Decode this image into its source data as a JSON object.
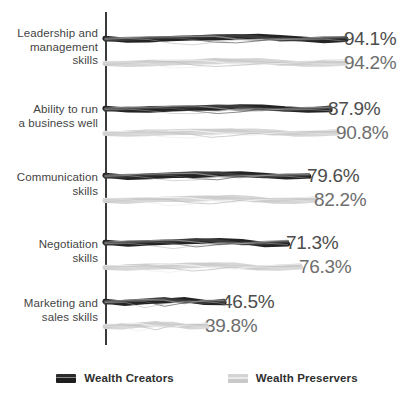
{
  "chart_data": {
    "type": "bar",
    "orientation": "horizontal",
    "title": "",
    "subtitle": "",
    "xlabel": "",
    "ylabel": "",
    "grid": false,
    "xlim": [
      0,
      100
    ],
    "legend_position": "bottom-center",
    "categories": [
      "Leadership and\nmanagement\nskills",
      "Ability to run\na business well",
      "Communication\nskills",
      "Negotiation\nskills",
      "Marketing and\nsales skills"
    ],
    "series": [
      {
        "name": "Wealth Creators",
        "color": "#2b2b2b",
        "values": [
          94.1,
          87.9,
          79.6,
          71.3,
          46.5
        ],
        "labels": [
          "94.1%",
          "87.9%",
          "79.6%",
          "71.3%",
          "46.5%"
        ]
      },
      {
        "name": "Wealth Preservers",
        "color": "#d2d2d2",
        "values": [
          94.2,
          90.8,
          82.2,
          76.3,
          39.8
        ],
        "labels": [
          "94.2%",
          "90.8%",
          "82.2%",
          "76.3%",
          "39.8%"
        ]
      }
    ]
  },
  "legend": {
    "items": [
      {
        "label": "Wealth Creators",
        "swatch": "dark-bar-swatch-icon"
      },
      {
        "label": "Wealth Preservers",
        "swatch": "light-bar-swatch-icon"
      }
    ]
  }
}
